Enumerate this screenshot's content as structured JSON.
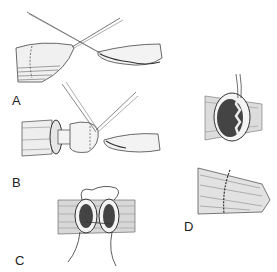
{
  "figure": {
    "panels": [
      {
        "id": "A",
        "label": "A",
        "description": "Two tubular stumps approached with crossed double-armed sutures"
      },
      {
        "id": "B",
        "label": "B",
        "description": "Inner tube end telescoped/invaginated with sutures placed"
      },
      {
        "id": "C",
        "label": "C",
        "description": "Two open lumens side by side with suture looped over"
      },
      {
        "id": "D",
        "label": "D",
        "description": "Lumen with running suture, and completed circumferential anastomosis"
      }
    ],
    "colors": {
      "ink": "#333333",
      "shade": "#9a9a9a",
      "fill": "#f2f2f2",
      "dark": "#555555"
    }
  }
}
